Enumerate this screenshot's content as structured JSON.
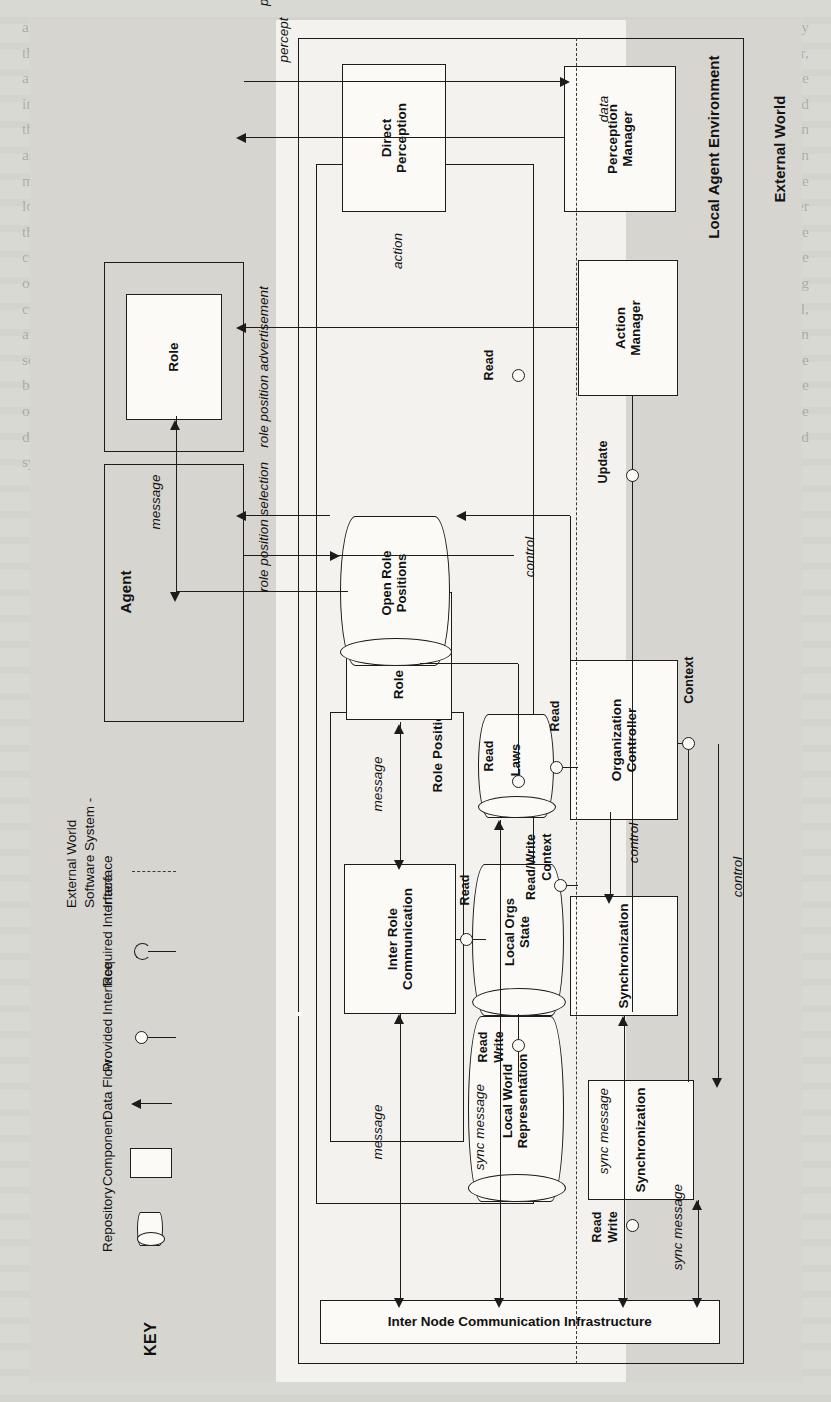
{
  "figure": {
    "type": "software-architecture-diagram",
    "orientation": "rotated-90-ccw",
    "regions": {
      "external_world": "External World",
      "local_agent_environment": "Local Agent Environment"
    }
  },
  "key": {
    "title": "KEY",
    "items": [
      {
        "symbol": "cylinder",
        "icon": "repository-icon",
        "label": "Repository"
      },
      {
        "symbol": "rectangle",
        "icon": "component-icon",
        "label": "Component"
      },
      {
        "symbol": "arrow",
        "icon": "data-flow-arrow-icon",
        "label": "Data Flow"
      },
      {
        "symbol": "ball-on-stick",
        "icon": "provided-interface-icon",
        "label": "Provided Interface"
      },
      {
        "symbol": "socket-on-stick",
        "icon": "required-interface-icon",
        "label": "Required Interface"
      },
      {
        "symbol": "dashed-line",
        "icon": "system-boundary-icon",
        "label": "Interface\nSoftware System -\nExternal World",
        "label_lines": [
          "Interface",
          "Software System -",
          "External World"
        ]
      }
    ]
  },
  "containers": {
    "agent": "Agent",
    "role": "Role",
    "organization_manager": "Organization Manager",
    "role_position_pool": "Role Position Pool",
    "local_agent_environment": "Local Agent Environment",
    "external_world": "External World"
  },
  "components": [
    {
      "id": "role",
      "label": "Role"
    },
    {
      "id": "role-position",
      "label": "Role Position"
    },
    {
      "id": "inter-role-communication",
      "label": "Inter Role\nCommunication",
      "lines": [
        "Inter Role",
        "Communication"
      ]
    },
    {
      "id": "organization-controller",
      "label": "Organization\nController",
      "lines": [
        "Organization",
        "Controller"
      ]
    },
    {
      "id": "synchronization-orgs",
      "label": "Synchronization"
    },
    {
      "id": "synchronization-world",
      "label": "Synchronization"
    },
    {
      "id": "action-manager",
      "label": "Action\nManager",
      "lines": [
        "Action",
        "Manager"
      ]
    },
    {
      "id": "perception-manager",
      "label": "Perception\nManager",
      "lines": [
        "Perception",
        "Manager"
      ]
    },
    {
      "id": "direct-perception",
      "label": "Direct\nPerception",
      "lines": [
        "Direct",
        "Perception"
      ]
    },
    {
      "id": "inter-node-comm-infrastructure",
      "label": "Inter Node Communication Infrastructure"
    }
  ],
  "repositories": [
    {
      "id": "open-role-positions",
      "label": "Open Role\nPositions",
      "lines": [
        "Open Role",
        "Positions"
      ]
    },
    {
      "id": "local-orgs-state",
      "label": "Local Orgs\nState",
      "lines": [
        "Local Orgs",
        "State"
      ]
    },
    {
      "id": "laws",
      "label": "Laws"
    },
    {
      "id": "local-world-representation",
      "label": "Local World\nRepresentation",
      "lines": [
        "Local World",
        "Representation"
      ]
    }
  ],
  "interface_labels": [
    {
      "id": "read-role-position-orgs",
      "label": "Read"
    },
    {
      "id": "read-irc-orgs",
      "label": "Read"
    },
    {
      "id": "read-write-orgs-sync",
      "label": "Read\nWrite",
      "lines": [
        "Read",
        "Write"
      ]
    },
    {
      "id": "read-laws",
      "label": "Read"
    },
    {
      "id": "read-write-context-orgs",
      "label": "Read/Write\nContext",
      "lines": [
        "Read/Write",
        "Context"
      ]
    },
    {
      "id": "context-lwr",
      "label": "Context"
    },
    {
      "id": "update-lwr",
      "label": "Update"
    },
    {
      "id": "read-lwr",
      "label": "Read"
    },
    {
      "id": "read-write-lwr-sync",
      "label": "Read\nWrite",
      "lines": [
        "Read",
        "Write"
      ]
    }
  ],
  "flow_labels": [
    {
      "id": "flow-message-role",
      "label": "message"
    },
    {
      "id": "flow-message-irc",
      "label": "message"
    },
    {
      "id": "flow-message-innode",
      "label": "message"
    },
    {
      "id": "flow-action",
      "label": "action"
    },
    {
      "id": "flow-percept",
      "label": "percept"
    },
    {
      "id": "flow-perception-request",
      "label": "perception request"
    },
    {
      "id": "flow-role-position-advert",
      "label": "role position advertisement"
    },
    {
      "id": "flow-role-position-select",
      "label": "role position selection"
    },
    {
      "id": "flow-control-pool",
      "label": "control"
    },
    {
      "id": "flow-control-sync-orgs",
      "label": "control"
    },
    {
      "id": "flow-control-sync-world",
      "label": "control"
    },
    {
      "id": "flow-sync-message-orgs",
      "label": "sync message"
    },
    {
      "id": "flow-sync-message-ctrl",
      "label": "sync message"
    },
    {
      "id": "flow-sync-message-world",
      "label": "sync message"
    },
    {
      "id": "flow-data",
      "label": "data"
    },
    {
      "id": "flow-low-level-message",
      "label": "low-level message"
    },
    {
      "id": "flow-low-level-data-sync",
      "label": "low-level data"
    },
    {
      "id": "flow-low-level-data-dp",
      "label": "low-level data"
    },
    {
      "id": "flow-low-level-action",
      "label": "low-level\naction",
      "lines": [
        "low-level",
        "action"
      ]
    }
  ],
  "colors": {
    "page": "#d9d9d4",
    "sheet": "#f3f2ee",
    "band": "#d6d5d0",
    "ink": "#1c1c1c"
  },
  "ghost_text": "scanned book page text shows faintly behind the figure"
}
